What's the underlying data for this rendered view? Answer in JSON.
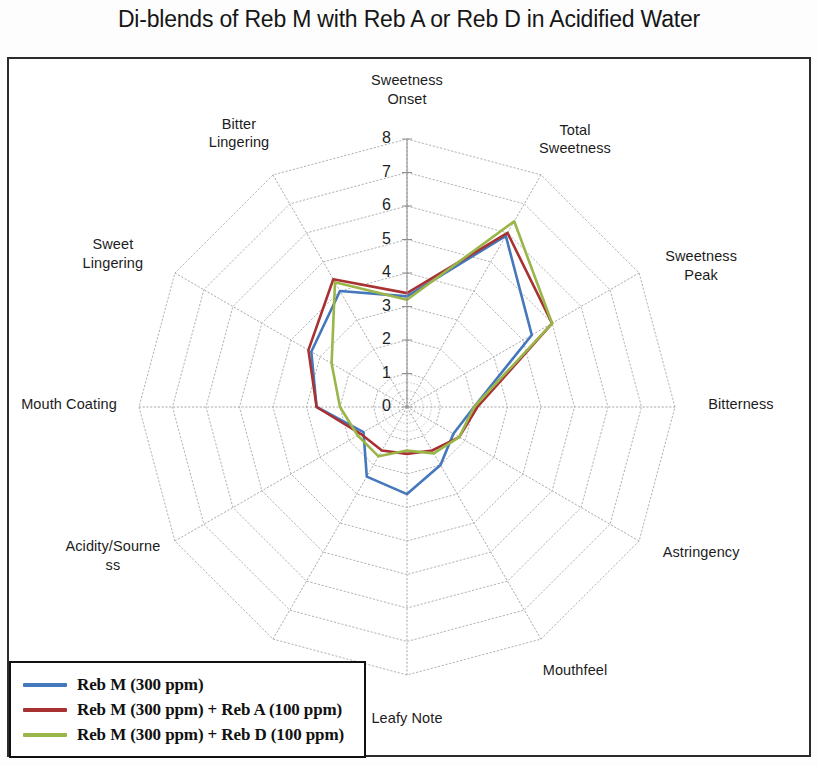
{
  "chart_title": "Di-blends of Reb M with Reb A or Reb D in Acidified Water",
  "legend": {
    "items": [
      {
        "label": "Reb M (300 ppm)",
        "color": "#4477bb"
      },
      {
        "label": "Reb M (300 ppm) + Reb A (100 ppm)",
        "color": "#a83232"
      },
      {
        "label": "Reb M (300 ppm) + Reb D (100 ppm)",
        "color": "#9ab648"
      }
    ]
  },
  "chart_data": {
    "type": "radar",
    "title": "Di-blends of Reb M with Reb A or Reb D in Acidified Water",
    "xlabel": "",
    "ylabel": "",
    "rlim": [
      0,
      8
    ],
    "tick_labels": [
      "0",
      "1",
      "2",
      "3",
      "4",
      "5",
      "6",
      "7",
      "8"
    ],
    "grid": true,
    "legend_position": "bottom-left",
    "categories": [
      "Sweetness Onset",
      "Total Sweetness",
      "Sweetness Peak",
      "Bitterness",
      "Astringency",
      "Mouthfeel",
      "Leafy Note",
      "Licorice",
      "Acidity/Sourness",
      "Mouth Coating",
      "Sweet Lingering",
      "Bitter Lingering"
    ],
    "category_display": [
      "Sweetness\nOnset",
      "Total\nSweetness",
      "Sweetness\nPeak",
      "Bitterness",
      "Astringency",
      "Mouthfeel",
      "Leafy Note",
      "Licorice",
      "Acidity/Sourne\nss",
      "Mouth Coating",
      "Sweet\nLingering",
      "Bitter\nLingering"
    ],
    "series": [
      {
        "name": "Reb M (300 ppm)",
        "color": "#4477bb",
        "values": [
          3.3,
          5.9,
          4.3,
          2.0,
          1.6,
          2.0,
          2.6,
          2.4,
          1.5,
          2.7,
          3.3,
          4.0
        ]
      },
      {
        "name": "Reb M (300 ppm) + Reb A (100 ppm)",
        "color": "#a83232",
        "values": [
          3.4,
          6.0,
          5.0,
          2.1,
          1.8,
          1.5,
          1.4,
          1.5,
          1.6,
          2.7,
          3.4,
          4.4
        ]
      },
      {
        "name": "Reb M (300 ppm) + Reb D (100 ppm)",
        "color": "#9ab648",
        "values": [
          3.2,
          6.4,
          5.0,
          2.0,
          1.8,
          1.6,
          1.3,
          1.7,
          1.7,
          2.0,
          2.6,
          4.3
        ]
      }
    ]
  }
}
